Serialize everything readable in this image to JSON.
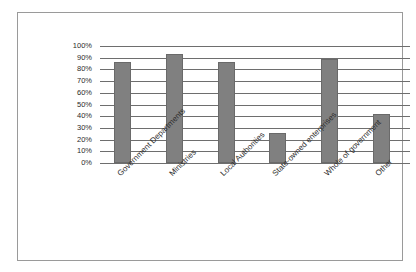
{
  "chart_data": {
    "type": "bar",
    "title": "",
    "xlabel": "",
    "ylabel": "",
    "ylim": [
      0,
      100
    ],
    "grid": true,
    "legend": false,
    "categories": [
      "Government Departments",
      "Ministries",
      "Local Authorities",
      "State-owned enterprises",
      "Whole of government",
      "Other"
    ],
    "values": [
      86,
      93,
      86,
      26,
      89,
      42
    ],
    "ytick_labels": [
      "100%",
      "90%",
      "80%",
      "70%",
      "60%",
      "50%",
      "40%",
      "30%",
      "20%",
      "10%",
      "0%"
    ],
    "ytick_values": [
      100,
      90,
      80,
      70,
      60,
      50,
      40,
      30,
      20,
      10,
      0
    ],
    "bar_color": "#808080",
    "grid_color": "#6e6e6e",
    "frame_color": "#9a9a9a",
    "background_color": "#ffffff"
  }
}
